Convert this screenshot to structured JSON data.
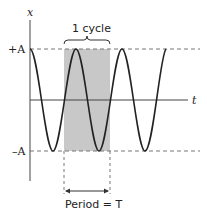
{
  "diagram": {
    "axes": {
      "x_label": "t",
      "y_label": "x"
    },
    "levels": {
      "top_label": "+A",
      "bottom_label": "–A"
    },
    "bracket_label": "1 cycle",
    "period_label": "Period = T"
  },
  "colors": {
    "curve": "#222222",
    "shade": "#c8c8c8",
    "dash": "#777777"
  }
}
